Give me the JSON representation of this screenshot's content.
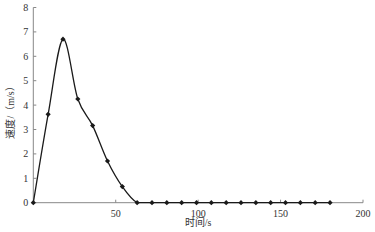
{
  "chart_data": {
    "type": "line",
    "title": "",
    "xlabel": "时间/s",
    "ylabel": "速度/（m/s）",
    "xlim": [
      0,
      200
    ],
    "ylim": [
      0,
      8
    ],
    "x_ticks": [
      50,
      100,
      150,
      200
    ],
    "y_ticks": [
      0,
      1,
      2,
      3,
      4,
      5,
      6,
      7,
      8
    ],
    "grid": false,
    "legend": null,
    "series": [
      {
        "name": "速度",
        "marker": "diamond",
        "smooth": true,
        "x": [
          0,
          9,
          18,
          27,
          36,
          45,
          54,
          63,
          72,
          81,
          90,
          99,
          108,
          117,
          126,
          135,
          144,
          153,
          162,
          171,
          180
        ],
        "values": [
          0,
          3.62,
          6.7,
          4.25,
          3.16,
          1.71,
          0.66,
          0,
          0,
          0,
          0,
          0,
          0,
          0,
          0,
          0,
          0,
          0,
          0,
          0,
          0
        ]
      }
    ]
  },
  "colors": {
    "line": "#1a1a1a",
    "axis": "#666666",
    "text": "#333333"
  }
}
